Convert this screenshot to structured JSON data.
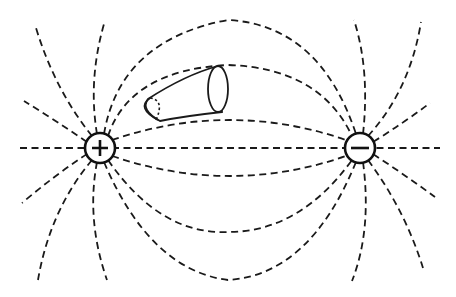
{
  "diagram": {
    "type": "electric-dipole-field-lines",
    "charges": [
      {
        "name": "positive",
        "symbol": "+",
        "cx": 100,
        "cy": 148,
        "r": 15
      },
      {
        "name": "negative",
        "symbol": "−",
        "cx": 360,
        "cy": 148,
        "r": 15
      }
    ],
    "flux_tube": {
      "label": "flux tube",
      "near_end": [
        150,
        85
      ],
      "far_end": [
        218,
        68
      ]
    },
    "line_style": "dashed",
    "colors": {
      "line": "#1a1a1a",
      "background": "#ffffff"
    }
  }
}
